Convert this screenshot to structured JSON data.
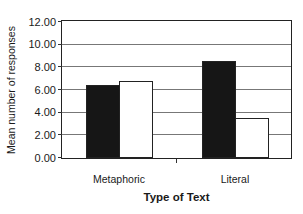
{
  "chart_data": {
    "type": "bar",
    "title": "",
    "xlabel": "Type of Text",
    "ylabel": "Mean number of responses",
    "categories": [
      "Metaphoric",
      "Literal"
    ],
    "series": [
      {
        "name": "Series 1 (black)",
        "color": "#161616",
        "values": [
          6.4,
          8.6
        ]
      },
      {
        "name": "Series 2 (white)",
        "color": "#ffffff",
        "values": [
          6.8,
          3.5
        ]
      }
    ],
    "ylim": [
      0,
      12
    ],
    "yticks": [
      "0.00",
      "2.00",
      "4.00",
      "6.00",
      "8.00",
      "10.00",
      "12.00"
    ],
    "grid": true,
    "legend": "none"
  }
}
